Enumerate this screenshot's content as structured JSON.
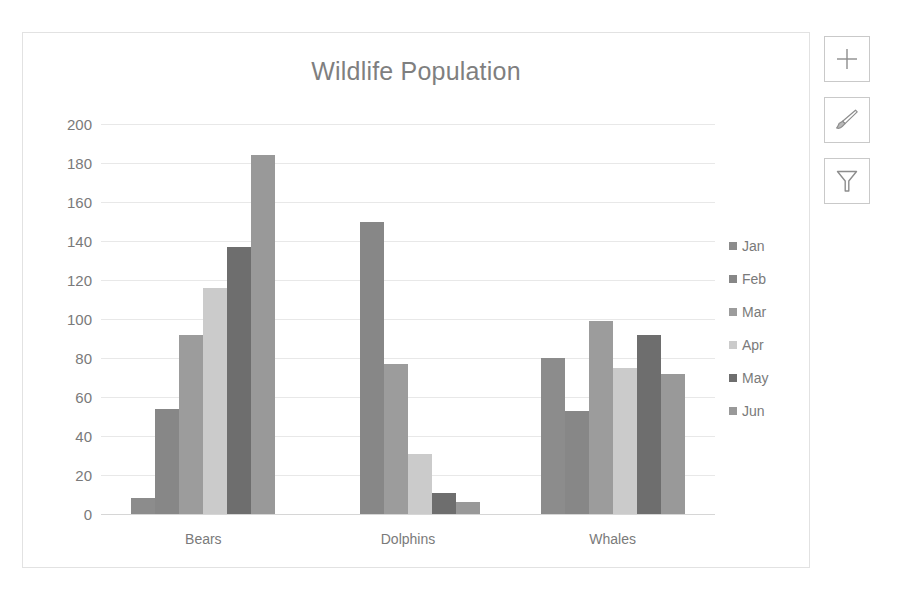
{
  "chart_data": {
    "type": "bar",
    "title": "Wildlife Population",
    "xlabel": "",
    "ylabel": "",
    "categories": [
      "Bears",
      "Dolphins",
      "Whales"
    ],
    "series": [
      {
        "name": "Jan",
        "color": "#8c8c8c",
        "values": [
          8,
          0,
          80
        ]
      },
      {
        "name": "Feb",
        "color": "#878787",
        "values": [
          54,
          150,
          53
        ]
      },
      {
        "name": "Mar",
        "color": "#9c9c9c",
        "values": [
          92,
          77,
          99
        ]
      },
      {
        "name": "Apr",
        "color": "#cbcbcb",
        "values": [
          116,
          31,
          75
        ]
      },
      {
        "name": "May",
        "color": "#6e6e6e",
        "values": [
          137,
          11,
          92
        ]
      },
      {
        "name": "Jun",
        "color": "#999999",
        "values": [
          184,
          6,
          72
        ]
      }
    ],
    "ylim": [
      0,
      200
    ],
    "ytick_step": 20,
    "yticks": [
      "200",
      "180",
      "160",
      "140",
      "120",
      "100",
      "80",
      "60",
      "40",
      "20",
      "0"
    ],
    "grid": true,
    "legend_position": "right"
  },
  "style": {
    "title_color": "#7f7f7f",
    "tick_color": "#7a7a7a",
    "grid_color": "#e8e8e8",
    "frame_color": "#e2e2e2"
  },
  "chart_tools": [
    {
      "name": "chart-elements",
      "icon": "plus-icon",
      "tooltip": "Chart Elements"
    },
    {
      "name": "chart-styles",
      "icon": "paintbrush-icon",
      "tooltip": "Chart Styles"
    },
    {
      "name": "chart-filters",
      "icon": "funnel-icon",
      "tooltip": "Chart Filters"
    }
  ]
}
